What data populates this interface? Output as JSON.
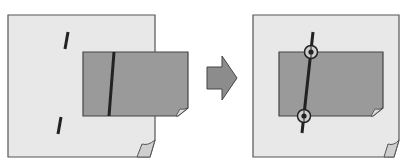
{
  "diagram": {
    "colors": {
      "page_fill": "#e8e8e8",
      "page_stroke": "#555555",
      "sheet_fill": "#9a9a9a",
      "mark_color": "#222222",
      "arrow_fill": "#8c8c8c"
    },
    "steps": [
      {
        "name": "before",
        "marks": [
          "upper-mark",
          "lower-mark",
          "sheet-line"
        ]
      },
      {
        "name": "after",
        "marks": [
          "aligned-line",
          "top-circle-marker",
          "bottom-circle-marker"
        ]
      }
    ]
  }
}
